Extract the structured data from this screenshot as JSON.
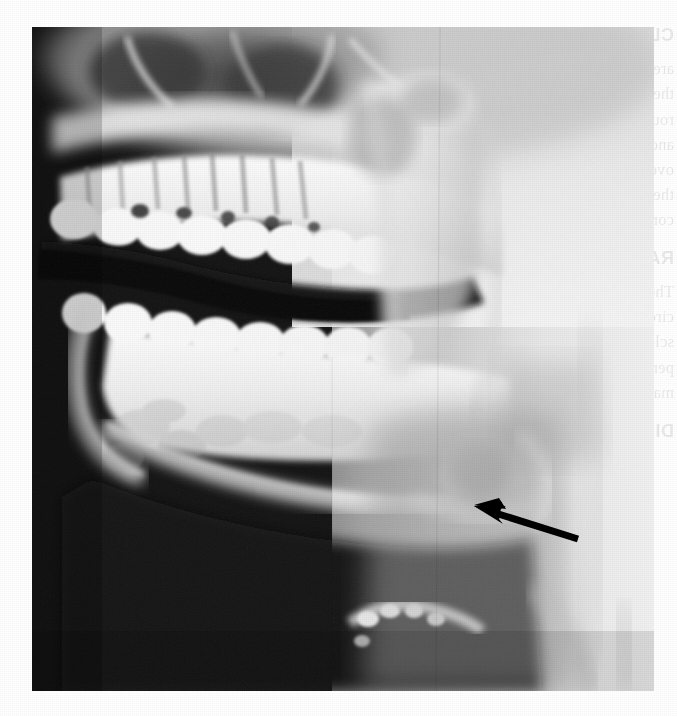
{
  "figure": {
    "type": "panoramic-dental-radiograph",
    "view": "right lateral hemi-panoramic",
    "background_color": "#ffffff",
    "plate": {
      "x": 32,
      "y": 27,
      "width": 622,
      "height": 664,
      "darkest_color": "#070707",
      "brightest_color": "#fbfbfb",
      "soft_tissue_color": "#b9b9b9"
    },
    "anatomy_labels": [
      "maxillary teeth",
      "mandibular teeth",
      "mandibular body",
      "mandibular ramus",
      "mandibular angle",
      "condyle",
      "coronoid process",
      "maxillary sinus",
      "oropharyngeal air space",
      "hyoid bone",
      "cervical soft tissue"
    ]
  },
  "annotation": {
    "arrow": {
      "icon": "arrow-left-icon",
      "color": "#000000",
      "tip_x": 476,
      "tip_y": 510,
      "tail_x": 576,
      "tail_y": 538,
      "shaft_width": 6,
      "head_length": 28,
      "description": "black arrow pointing up-left at radiolucent lesion near mandibular angle"
    }
  },
  "showthrough": {
    "description": "mirrored bleed-through text from the reverse side of the printed page",
    "opacity": 0.085,
    "heading": "CLINICAL FEATURES",
    "lines": [
      "are usually asymptomatic",
      "they are discovered on",
      "routine radiographic examination",
      "and may be slightly tender to",
      "overlying mucosa is normal in",
      "there is no expansion of the",
      "cortical plates.",
      "",
      "RADIOGRAPHIC FEATURES",
      "The lesion appears as a well-",
      "circumscribed radiolucency with",
      "sclerotic borders located at the",
      "periapical region of the",
      "mandibular posterior teeth.",
      "",
      "DIAGNOSIS"
    ]
  }
}
